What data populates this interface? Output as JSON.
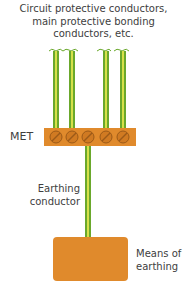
{
  "diagram": {
    "title_lines": [
      "Circuit protective conductors,",
      "main protective bonding",
      "conductors, etc."
    ],
    "met_label": "MET",
    "earthing_conductor_label_lines": [
      "Earthing",
      "conductor"
    ],
    "means_of_earthing_label_lines": [
      "Means of",
      "earthing"
    ],
    "conductor_count_top": 4,
    "terminal_screw_count": 5,
    "colors": {
      "conductor_green": "#6aa82c",
      "conductor_yellow": "#d6e04a",
      "conductor_outline": "#3d6b1a",
      "terminal_bar": "#e08a2c",
      "screw": "#d07a22",
      "screw_outline": "#9c5a18",
      "earth_block": "#e08a2c",
      "text": "#404040"
    }
  }
}
